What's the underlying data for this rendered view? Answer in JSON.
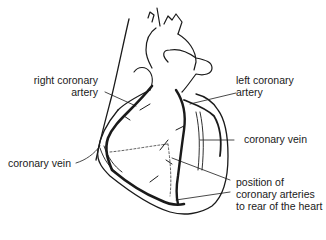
{
  "diagram": {
    "labels": {
      "right_coronary_artery": {
        "line1": "right coronary",
        "line2": "artery"
      },
      "left_coronary_artery": {
        "line1": "left coronary",
        "line2": "artery"
      },
      "coronary_vein_left": {
        "text": "coronary vein"
      },
      "coronary_vein_right": {
        "text": "coronary vein"
      },
      "rear_arteries": {
        "line1": "position of",
        "line2": "coronary arteries",
        "line3": "to rear of the heart"
      }
    },
    "colors": {
      "ink": "#1a1a1a",
      "background": "#ffffff"
    }
  }
}
